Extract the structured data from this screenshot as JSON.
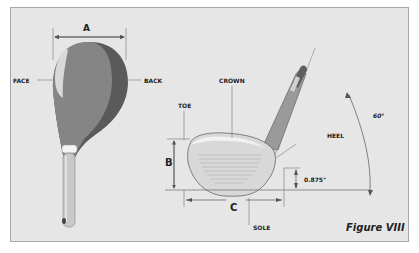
{
  "figure": {
    "caption": "Figure VIII",
    "colors": {
      "background": "#e6e6e6",
      "border": "#a8a8a8",
      "head_light": "#858585",
      "head_dark": "#5a5a5a",
      "face_highlight": "#d9d9d9",
      "shaft": "#c8c8c8",
      "ferrule": "#f4f4f4",
      "line": "#555555"
    }
  },
  "top_view": {
    "dimension_label": "A",
    "face_label": "FACE",
    "back_label": "BACK"
  },
  "face_view": {
    "crown_label": "CROWN",
    "toe_label": "TOE",
    "heel_label": "HEEL",
    "sole_label": "SOLE",
    "height_dimension_label": "B",
    "length_dimension_label": "C",
    "heel_height_value": "0.875\"",
    "lie_angle_value": "60°"
  }
}
